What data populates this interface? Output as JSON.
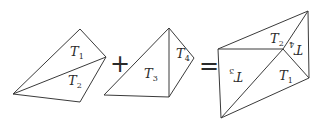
{
  "diagram": {
    "shapes": {
      "left": {
        "triangles": [
          {
            "label": "T",
            "subscript": "1"
          },
          {
            "label": "T",
            "subscript": "2"
          }
        ]
      },
      "middle": {
        "triangles": [
          {
            "label": "T",
            "subscript": "3"
          },
          {
            "label": "T",
            "subscript": "4"
          }
        ]
      },
      "result": {
        "triangles": [
          {
            "label": "T",
            "subscript": "2"
          },
          {
            "label": "T",
            "subscript": "4",
            "rotated": true
          },
          {
            "label": "T",
            "subscript": "3",
            "rotated": true
          },
          {
            "label": "T",
            "subscript": "1"
          }
        ]
      }
    },
    "operators": {
      "plus": "+",
      "equals": "="
    },
    "colors": {
      "stroke": "#3a3a3a",
      "text": "#2a2a2a",
      "background": "#ffffff"
    }
  }
}
